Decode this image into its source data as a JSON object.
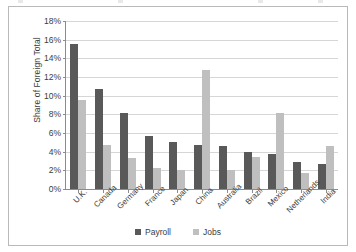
{
  "chart_data": {
    "type": "bar",
    "title": "",
    "xlabel": "",
    "ylabel": "Share of Foreign Total",
    "ylim": [
      0,
      18
    ],
    "ytick_labels": [
      "0%",
      "2%",
      "4%",
      "6%",
      "8%",
      "10%",
      "12%",
      "14%",
      "16%",
      "18%"
    ],
    "ytick_values": [
      0,
      2,
      4,
      6,
      8,
      10,
      12,
      14,
      16,
      18
    ],
    "grid": true,
    "legend_position": "bottom",
    "categories": [
      "U.K.",
      "Canada",
      "Germany",
      "France",
      "Japan",
      "China",
      "Australia",
      "Brazil",
      "Mexico",
      "Netherlands",
      "India"
    ],
    "series": [
      {
        "name": "Payroll",
        "color": "#595959",
        "values": [
          15.5,
          10.7,
          8.1,
          5.7,
          5.0,
          4.7,
          4.6,
          4.0,
          3.7,
          2.9,
          2.7
        ]
      },
      {
        "name": "Jobs",
        "color": "#bfbfbf",
        "values": [
          9.5,
          4.7,
          3.3,
          2.3,
          2.0,
          12.7,
          2.0,
          3.4,
          8.1,
          1.7,
          4.6
        ]
      }
    ]
  }
}
